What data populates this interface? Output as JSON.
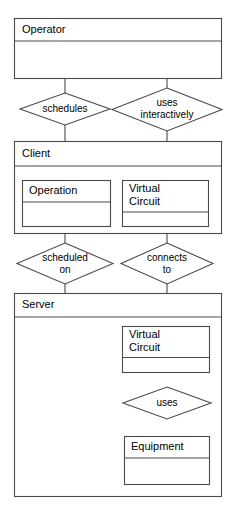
{
  "diagram": {
    "type": "entity-relationship-diagram",
    "background_color": "#ffffff",
    "line_color": "#4a4a4a",
    "text_color": "#000000",
    "entities": {
      "operator": {
        "label": "Operator"
      },
      "client": {
        "label": "Client"
      },
      "client_operation": {
        "label": "Operation"
      },
      "client_virtual_circuit_line1": {
        "label": "Virtual"
      },
      "client_virtual_circuit_line2": {
        "label": "Circuit"
      },
      "server": {
        "label": "Server"
      },
      "server_virtual_circuit_line1": {
        "label": "Virtual"
      },
      "server_virtual_circuit_line2": {
        "label": "Circuit"
      },
      "equipment": {
        "label": "Equipment"
      }
    },
    "relationships": {
      "schedules": {
        "label": "schedules"
      },
      "uses_interactively_line1": {
        "label": "uses"
      },
      "uses_interactively_line2": {
        "label": "interactively"
      },
      "scheduled_on_line1": {
        "label": "scheduled"
      },
      "scheduled_on_line2": {
        "label": "on"
      },
      "connects_to_line1": {
        "label": "connects"
      },
      "connects_to_line2": {
        "label": "to"
      },
      "uses": {
        "label": "uses"
      }
    }
  }
}
